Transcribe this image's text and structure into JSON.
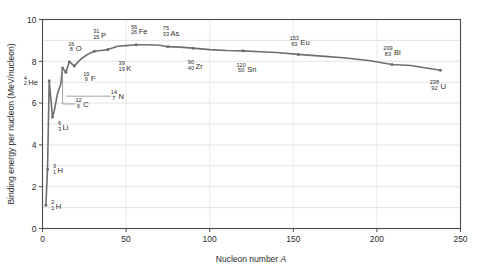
{
  "chart_data": {
    "type": "line",
    "title": "",
    "xlabel": "Nucleon number A",
    "ylabel": "Binding energy per nucleon (MeV/nucleon)",
    "xlim": [
      0,
      250
    ],
    "ylim": [
      0,
      10
    ],
    "xticks": [
      0,
      50,
      100,
      150,
      200,
      250
    ],
    "yticks": [
      0,
      2,
      4,
      6,
      8,
      10
    ],
    "xtick_labels": [
      "0",
      "50",
      "100",
      "150",
      "200",
      "250"
    ],
    "ytick_labels": [
      "0",
      "2",
      "4",
      "6",
      "8",
      "10"
    ],
    "grid": "horizontal gridlines every 1 MeV, vertical gridlines at each major x tick",
    "legend": "none",
    "line_color": "#6e6e6e",
    "marker_color": "#6e6e6e",
    "x": [
      2,
      3,
      4,
      6,
      7,
      9,
      11,
      12,
      14,
      16,
      19,
      23,
      27,
      31,
      35,
      39,
      45,
      50,
      56,
      62,
      70,
      75,
      82,
      90,
      100,
      110,
      120,
      130,
      140,
      153,
      165,
      180,
      195,
      209,
      220,
      238
    ],
    "values": [
      1.1,
      2.83,
      7.07,
      5.33,
      5.61,
      6.46,
      6.93,
      7.68,
      7.48,
      7.98,
      7.78,
      8.11,
      8.33,
      8.48,
      8.52,
      8.56,
      8.72,
      8.75,
      8.79,
      8.79,
      8.77,
      8.7,
      8.68,
      8.63,
      8.56,
      8.52,
      8.5,
      8.46,
      8.42,
      8.33,
      8.26,
      8.17,
      8.04,
      7.85,
      7.8,
      7.57
    ],
    "labeled_points": [
      {
        "A": 2,
        "Z": 1,
        "symbol": "H",
        "mass": "2",
        "charge": "1",
        "x": 2,
        "y": 1.11,
        "lx": 2,
        "ly": 1.11,
        "label_dx": 7,
        "label_dy": 3,
        "leader": "none"
      },
      {
        "A": 3,
        "Z": 1,
        "symbol": "H",
        "mass": "3",
        "charge": "1",
        "x": 3,
        "y": 2.83,
        "lx": 3,
        "ly": 2.83,
        "label_dx": 7,
        "label_dy": 3,
        "leader": "none"
      },
      {
        "A": 6,
        "Z": 3,
        "symbol": "Li",
        "mass": "6",
        "charge": "3",
        "x": 6,
        "y": 5.33,
        "lx": 6,
        "ly": 5.33,
        "label_dx": 7,
        "label_dy": 12,
        "leader": "none"
      },
      {
        "A": 4,
        "Z": 2,
        "symbol": "He",
        "mass": "4",
        "charge": "2",
        "x": 4,
        "y": 7.07,
        "lx": 4,
        "ly": 7.07,
        "label_dx": -24,
        "label_dy": 3,
        "leader": "none"
      },
      {
        "A": 12,
        "Z": 6,
        "symbol": "C",
        "mass": "12",
        "charge": "6",
        "x": 12,
        "y": 7.68,
        "lx": 12,
        "ly": 7.68,
        "label_dx": 16,
        "label_dy": 38,
        "leader": "elbow-left"
      },
      {
        "A": 14,
        "Z": 7,
        "symbol": "N",
        "mass": "14",
        "charge": "7",
        "x": 14,
        "y": 7.48,
        "lx": 14,
        "ly": 7.48,
        "label_dx": 48,
        "label_dy": 26,
        "leader": "horizontal"
      },
      {
        "A": 16,
        "Z": 8,
        "symbol": "O",
        "mass": "16",
        "charge": "8",
        "x": 16,
        "y": 7.98,
        "lx": 16,
        "ly": 7.98,
        "label_dx": 2,
        "label_dy": -12,
        "leader": "none"
      },
      {
        "A": 19,
        "Z": 9,
        "symbol": "F",
        "mass": "19",
        "charge": "9",
        "x": 19,
        "y": 7.78,
        "lx": 19,
        "ly": 7.78,
        "label_dx": 12,
        "label_dy": 14,
        "leader": "none"
      },
      {
        "A": 31,
        "Z": 15,
        "symbol": "P",
        "mass": "31",
        "charge": "15",
        "x": 31,
        "y": 8.48,
        "lx": 31,
        "ly": 8.48,
        "label_dx": 2,
        "label_dy": -14,
        "leader": "none"
      },
      {
        "A": 39,
        "Z": 19,
        "symbol": "K",
        "mass": "39",
        "charge": "19",
        "x": 39,
        "y": 8.56,
        "lx": 39,
        "ly": 8.56,
        "label_dx": 14,
        "label_dy": 20,
        "leader": "none"
      },
      {
        "A": 56,
        "Z": 26,
        "symbol": "Fe",
        "mass": "56",
        "charge": "26",
        "x": 56,
        "y": 8.79,
        "lx": 56,
        "ly": 8.79,
        "label_dx": -2,
        "label_dy": -12,
        "leader": "none"
      },
      {
        "A": 75,
        "Z": 33,
        "symbol": "As",
        "mass": "75",
        "charge": "33",
        "x": 75,
        "y": 8.7,
        "lx": 75,
        "ly": 8.7,
        "label_dx": -2,
        "label_dy": -12,
        "leader": "none"
      },
      {
        "A": 90,
        "Z": 40,
        "symbol": "Zr",
        "mass": "90",
        "charge": "40",
        "x": 90,
        "y": 8.63,
        "lx": 90,
        "ly": 8.63,
        "label_dx": -2,
        "label_dy": 20,
        "leader": "none"
      },
      {
        "A": 120,
        "Z": 50,
        "symbol": "Sn",
        "mass": "120",
        "charge": "50",
        "x": 120,
        "y": 8.5,
        "lx": 120,
        "ly": 8.5,
        "label_dx": -2,
        "label_dy": 20,
        "leader": "none"
      },
      {
        "A": 153,
        "Z": 63,
        "symbol": "Eu",
        "mass": "153",
        "charge": "63",
        "x": 153,
        "y": 8.33,
        "lx": 153,
        "ly": 8.33,
        "label_dx": -4,
        "label_dy": -10,
        "leader": "none"
      },
      {
        "A": 209,
        "Z": 83,
        "symbol": "Bi",
        "mass": "209",
        "charge": "83",
        "x": 209,
        "y": 7.85,
        "lx": 209,
        "ly": 7.85,
        "label_dx": -4,
        "label_dy": -10,
        "leader": "none"
      },
      {
        "A": 238,
        "Z": 92,
        "symbol": "U",
        "mass": "238",
        "charge": "92",
        "x": 238,
        "y": 7.57,
        "lx": 238,
        "ly": 7.57,
        "label_dx": -6,
        "label_dy": 18,
        "leader": "none"
      }
    ]
  },
  "axes": {
    "xlabel_text": "Nucleon number",
    "xlabel_italic": "A",
    "ylabel_text": "Binding energy per nucleon  (MeV/nucleon)"
  }
}
